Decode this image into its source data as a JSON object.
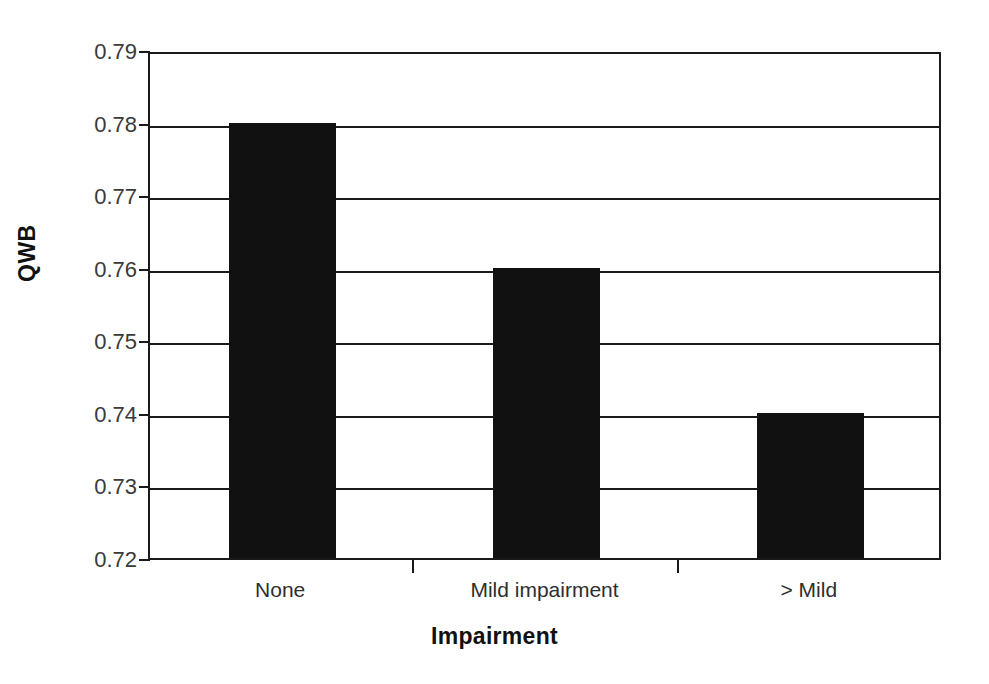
{
  "chart_data": {
    "type": "bar",
    "title": "",
    "subtitle": "",
    "categories": [
      "None",
      "Mild impairment",
      "> Mild"
    ],
    "values": [
      0.78,
      0.76,
      0.74
    ],
    "series": [
      {
        "name": "QWB",
        "values": [
          0.78,
          0.76,
          0.74
        ]
      }
    ],
    "xlabel": "Impairment",
    "ylabel": "QWB",
    "ylim": [
      0.72,
      0.79
    ],
    "yticks": [
      0.72,
      0.73,
      0.74,
      0.75,
      0.76,
      0.77,
      0.78,
      0.79
    ],
    "ytick_labels": [
      "0.72",
      "0.73",
      "0.74",
      "0.75",
      "0.76",
      "0.77",
      "0.78",
      "0.79"
    ],
    "ytick_step": 0.01,
    "xlim_categories": 3,
    "grid": "horizontal",
    "legend": "none",
    "bar_color": "#111111",
    "axis_color": "#1a1a1a",
    "background_color": "#ffffff",
    "annotations": []
  },
  "axes": {
    "y_title": "QWB",
    "x_title": "Impairment"
  }
}
